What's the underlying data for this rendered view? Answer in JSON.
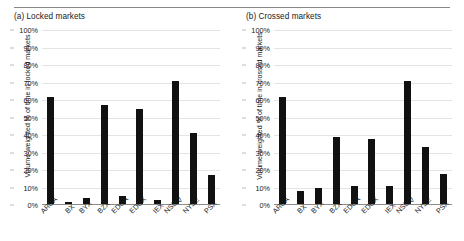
{
  "figure": {
    "panel_count": 2,
    "divider": "horizontal-rule"
  },
  "chart_data": [
    {
      "type": "bar",
      "title": "(a) Locked markets",
      "xlabel": "",
      "ylabel": "Volume-weighted % of time in locked markets",
      "categories": [
        "ARCA",
        "BX",
        "BYX",
        "BZX",
        "EDGA",
        "EDGX",
        "IEX",
        "NSDQ",
        "NYSE",
        "PSX"
      ],
      "values": [
        62,
        2,
        4,
        57,
        5,
        55,
        3,
        71,
        41,
        17
      ],
      "ylim": [
        0,
        100
      ],
      "ytick_labels": [
        "0%",
        "10%",
        "20%",
        "30%",
        "40%",
        "50%",
        "60%",
        "70%",
        "80%",
        "90%",
        "100%"
      ],
      "ytick_values": [
        0,
        10,
        20,
        30,
        40,
        50,
        60,
        70,
        80,
        90,
        100
      ],
      "grid": true,
      "legend": "none",
      "bar_color": "#111111"
    },
    {
      "type": "bar",
      "title": "(b) Crossed markets",
      "xlabel": "",
      "ylabel": "Volume-weighted % of time in crossed markets",
      "categories": [
        "ARCA",
        "BX",
        "BYX",
        "BZX",
        "EDGA",
        "EDGX",
        "IEX",
        "NSDQ",
        "NYSE",
        "PSX"
      ],
      "values": [
        62,
        8,
        10,
        39,
        11,
        38,
        11,
        71,
        33,
        18
      ],
      "ylim": [
        0,
        100
      ],
      "ytick_labels": [
        "0%",
        "10%",
        "20%",
        "30%",
        "40%",
        "50%",
        "60%",
        "70%",
        "80%",
        "90%",
        "100%"
      ],
      "ytick_values": [
        0,
        10,
        20,
        30,
        40,
        50,
        60,
        70,
        80,
        90,
        100
      ],
      "grid": true,
      "legend": "none",
      "bar_color": "#111111"
    }
  ],
  "colors": {
    "bar": "#111111",
    "gridline": "#e4e4e4",
    "axis": "#8c8c8c",
    "text": "#1a1a1a",
    "background": "#ffffff"
  }
}
